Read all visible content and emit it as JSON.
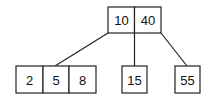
{
  "diagram": {
    "type": "b-tree",
    "root": {
      "keys": [
        "10",
        "40"
      ]
    },
    "children": [
      {
        "keys": [
          "2",
          "5",
          "8"
        ]
      },
      {
        "keys": [
          "15"
        ]
      },
      {
        "keys": [
          "55"
        ]
      }
    ]
  }
}
